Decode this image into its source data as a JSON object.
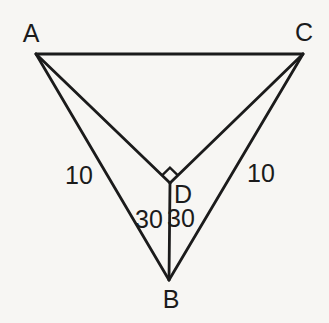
{
  "figure": {
    "background_color": "#f7f6f3",
    "line_color": "#1b1b1b",
    "text_color": "#1b1b1b",
    "line_width": 2.8,
    "points": {
      "A": {
        "x": 36,
        "y": 54
      },
      "C": {
        "x": 303,
        "y": 54
      },
      "B": {
        "x": 169,
        "y": 280
      },
      "D": {
        "x": 170,
        "y": 183
      }
    },
    "segments": [
      {
        "from": "A",
        "to": "C"
      },
      {
        "from": "A",
        "to": "B"
      },
      {
        "from": "C",
        "to": "B"
      },
      {
        "from": "A",
        "to": "D"
      },
      {
        "from": "C",
        "to": "D"
      },
      {
        "from": "D",
        "to": "B"
      }
    ],
    "right_angle_marker": {
      "vertex": "D",
      "ray1": "A",
      "ray2": "C",
      "size": 11
    },
    "vertex_labels": {
      "A": {
        "text": "A",
        "x": 31,
        "y": 33
      },
      "C": {
        "text": "C",
        "x": 304,
        "y": 32
      },
      "B": {
        "text": "B",
        "x": 171,
        "y": 299
      },
      "D": {
        "text": "D",
        "x": 183,
        "y": 194
      }
    },
    "measure_labels": {
      "side_ab": {
        "text": "10",
        "x": 79,
        "y": 175
      },
      "side_cb": {
        "text": "10",
        "x": 261,
        "y": 173
      },
      "angle_abd": {
        "text": "30",
        "x": 149,
        "y": 219
      },
      "angle_dbc": {
        "text": "30",
        "x": 181,
        "y": 218
      }
    }
  }
}
